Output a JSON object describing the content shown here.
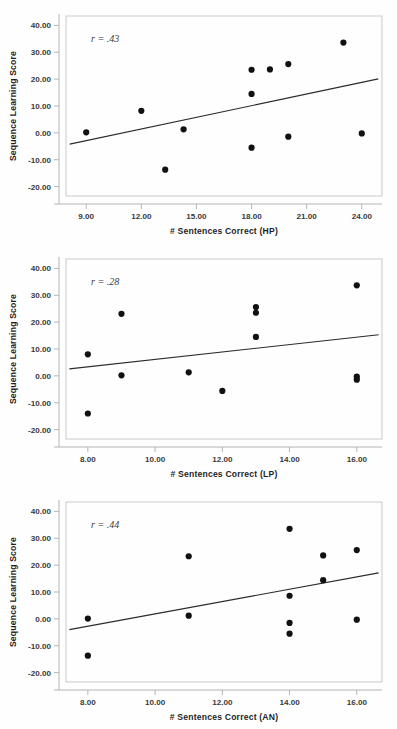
{
  "figure": {
    "background": "#fefefe",
    "point_color": "#111111",
    "line_color": "#2b2b2b",
    "frame_color": "#c9c9c9"
  },
  "chart_data": [
    {
      "type": "scatter",
      "title": "",
      "xlabel": "# Sentences Correct (HP)",
      "ylabel": "Sequence Learning Score",
      "annotation": "r = .43",
      "xlim": [
        7.9,
        25.1
      ],
      "ylim": [
        -23.5,
        43.5
      ],
      "xticks": [
        9,
        12,
        15,
        18,
        21,
        24
      ],
      "xticklabels": [
        "9.00",
        "12.00",
        "15.00",
        "18.00",
        "21.00",
        "24.00"
      ],
      "yticks": [
        40,
        30,
        20,
        10,
        0,
        -10,
        -20
      ],
      "yticklabels": [
        "40.00",
        "30.00",
        "20.00",
        "10.00",
        "0.00",
        "-10.00",
        "-20.00"
      ],
      "grid": false,
      "legend": "none",
      "points": [
        {
          "x": 9.0,
          "y": 0.2
        },
        {
          "x": 12.0,
          "y": 8.2
        },
        {
          "x": 13.3,
          "y": -13.7
        },
        {
          "x": 14.3,
          "y": 1.3
        },
        {
          "x": 18.0,
          "y": 23.5
        },
        {
          "x": 18.0,
          "y": 14.5
        },
        {
          "x": 18.0,
          "y": -5.5
        },
        {
          "x": 19.0,
          "y": 23.6
        },
        {
          "x": 20.0,
          "y": 25.6
        },
        {
          "x": 20.0,
          "y": -1.4
        },
        {
          "x": 23.0,
          "y": 33.6
        },
        {
          "x": 24.0,
          "y": -0.2
        }
      ],
      "fit_line": {
        "x0": 8.1,
        "y0": -4.2,
        "x1": 24.9,
        "y1": 20.1
      }
    },
    {
      "type": "scatter",
      "title": "",
      "xlabel": "# Sentences Correct (LP)",
      "ylabel": "Sequence Learning Score",
      "annotation": "r = .28",
      "xlim": [
        7.35,
        16.75
      ],
      "ylim": [
        -23.5,
        43.5
      ],
      "xticks": [
        8,
        10,
        12,
        14,
        16
      ],
      "xticklabels": [
        "8.00",
        "10.00",
        "12.00",
        "14.00",
        "16.00"
      ],
      "yticks": [
        40,
        30,
        20,
        10,
        0,
        -10,
        -20
      ],
      "yticklabels": [
        "40.00",
        "30.00",
        "20.00",
        "10.00",
        "0.00",
        "-10.00",
        "-20.00"
      ],
      "grid": false,
      "legend": "none",
      "points": [
        {
          "x": 8.0,
          "y": 8.0
        },
        {
          "x": 8.0,
          "y": -14.0
        },
        {
          "x": 9.0,
          "y": 23.1
        },
        {
          "x": 9.0,
          "y": 0.2
        },
        {
          "x": 11.0,
          "y": 1.3
        },
        {
          "x": 12.0,
          "y": -5.6
        },
        {
          "x": 13.0,
          "y": 25.6
        },
        {
          "x": 13.0,
          "y": 23.5
        },
        {
          "x": 13.0,
          "y": 14.5
        },
        {
          "x": 16.0,
          "y": 33.7
        },
        {
          "x": 16.0,
          "y": -0.3
        },
        {
          "x": 16.0,
          "y": -1.4
        }
      ],
      "fit_line": {
        "x0": 7.45,
        "y0": 2.6,
        "x1": 16.65,
        "y1": 15.3
      }
    },
    {
      "type": "scatter",
      "title": "",
      "xlabel": "# Sentences Correct (AN)",
      "ylabel": "Sequence Learning Score",
      "annotation": "r = .44",
      "xlim": [
        7.35,
        16.75
      ],
      "ylim": [
        -23.5,
        43.5
      ],
      "xticks": [
        8,
        10,
        12,
        14,
        16
      ],
      "xticklabels": [
        "8.00",
        "10.00",
        "12.00",
        "14.00",
        "16.00"
      ],
      "yticks": [
        40,
        30,
        20,
        10,
        0,
        -10,
        -20
      ],
      "yticklabels": [
        "40.00",
        "30.00",
        "20.00",
        "10.00",
        "0.00",
        "-10.00",
        "-20.00"
      ],
      "grid": false,
      "legend": "none",
      "points": [
        {
          "x": 8.0,
          "y": 0.1
        },
        {
          "x": 8.0,
          "y": -13.7
        },
        {
          "x": 11.0,
          "y": 23.3
        },
        {
          "x": 11.0,
          "y": 1.2
        },
        {
          "x": 14.0,
          "y": 33.5
        },
        {
          "x": 14.0,
          "y": 8.6
        },
        {
          "x": 14.0,
          "y": -1.5
        },
        {
          "x": 14.0,
          "y": -5.5
        },
        {
          "x": 15.0,
          "y": 23.6
        },
        {
          "x": 15.0,
          "y": 14.4
        },
        {
          "x": 16.0,
          "y": 25.6
        },
        {
          "x": 16.0,
          "y": -0.3
        }
      ],
      "fit_line": {
        "x0": 7.45,
        "y0": -4.0,
        "x1": 16.65,
        "y1": 17.1
      }
    }
  ]
}
